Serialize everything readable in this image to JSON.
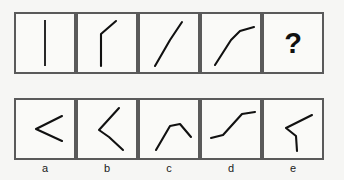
{
  "puzzle": {
    "type": "visual-analogy-sequence",
    "colors": {
      "background": "#f6f6f4",
      "panel_fill": "#fafaf8",
      "panel_border": "#5a5a5a",
      "stroke": "#111111",
      "label_text": "#1a1a1a"
    },
    "question_mark": "?",
    "sequence": {
      "panel_count": 5,
      "panels": [
        {
          "index": 1,
          "shape_name": "vertical-line",
          "description": "straight vertical line",
          "points": "29,6 29,52"
        },
        {
          "index": 2,
          "shape_name": "vertical-line-with-small-top-bend",
          "description": "vertical line with short bend to upper right at top",
          "points": "23,52 23,20 38,7"
        },
        {
          "index": 3,
          "shape_name": "diagonal-with-top-bend",
          "description": "diagonal rising to the right with a bend near the top",
          "points": "15,52 30,26 42,8"
        },
        {
          "index": 4,
          "shape_name": "diagonal-with-flat-top",
          "description": "diagonal rising to the right flattening to horizontal at top",
          "points": "13,51 29,26 38,17 52,13"
        },
        {
          "index": 5,
          "shape_name": "question-mark",
          "description": "unknown answer placeholder"
        }
      ]
    },
    "options": {
      "count": 5,
      "items": [
        {
          "letter": "a",
          "shape_name": "less-than-chevron",
          "description": "chevron pointing left, arms to upper right and lower right",
          "points": "46,16 20,29 46,41"
        },
        {
          "letter": "b",
          "shape_name": "bent-chevron-down-right",
          "description": "line from upper right down to vertex then down to lower right",
          "points": "41,8 21,30 31,37 45,50"
        },
        {
          "letter": "c",
          "shape_name": "peak-then-down-right",
          "description": "diagonal up from lower left to a peak then down to the right",
          "points": "16,50 30,26 40,24 51,37"
        },
        {
          "letter": "d",
          "shape_name": "flat-rise-flat",
          "description": "horizontal left, steep rise, horizontal right",
          "points": "9,38 21,35 40,14 53,12"
        },
        {
          "letter": "e",
          "shape_name": "chevron-with-vertical-tail",
          "description": "line from upper right down to vertex then straight down",
          "points": "48,15 22,28 32,36 33,51"
        }
      ]
    }
  }
}
